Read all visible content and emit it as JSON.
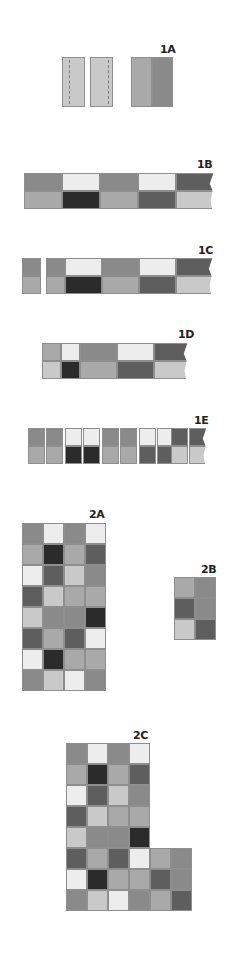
{
  "palette": {
    "W": "#ededed",
    "L": "#c9c9c9",
    "M": "#a9a9a9",
    "G": "#8a8a8a",
    "D": "#5e5e5e",
    "K": "#2b2b2b"
  },
  "labels": [
    {
      "id": "1A",
      "text": "1A",
      "x": 160,
      "y": 43
    },
    {
      "id": "1B",
      "text": "1B",
      "x": 197,
      "y": 158
    },
    {
      "id": "1C",
      "text": "1C",
      "x": 198,
      "y": 244
    },
    {
      "id": "1D",
      "text": "1D",
      "x": 178,
      "y": 328
    },
    {
      "id": "1E",
      "text": "1E",
      "x": 194,
      "y": 414
    },
    {
      "id": "2A",
      "text": "2A",
      "x": 89,
      "y": 508
    },
    {
      "id": "2B",
      "text": "2B",
      "x": 201,
      "y": 563
    },
    {
      "id": "2C",
      "text": "2C",
      "x": 133,
      "y": 729
    }
  ],
  "step_1A": {
    "strips": [
      {
        "x": 62,
        "y": 57,
        "w": 23,
        "h": 50,
        "color": "L",
        "seam_x": 6
      },
      {
        "x": 90,
        "y": 57,
        "w": 23,
        "h": 50,
        "color": "L",
        "seam_x": 17
      },
      {
        "x": 131,
        "y": 57,
        "w": 21,
        "h": 50,
        "color": "M"
      },
      {
        "x": 152,
        "y": 57,
        "w": 21,
        "h": 50,
        "color": "G"
      }
    ]
  },
  "step_1B": {
    "x": 24,
    "y": 173,
    "unit_w": 38,
    "unit_h": 18,
    "top": [
      "G",
      "W",
      "G",
      "W",
      "D"
    ],
    "bottom": [
      "M",
      "K",
      "M",
      "D",
      "L"
    ]
  },
  "step_1C": {
    "pieces": [
      {
        "x": 22,
        "y": 258,
        "w": 19,
        "top": "G",
        "bottom": "M"
      },
      {
        "x": 46,
        "y": 258,
        "w": 19,
        "top": "G",
        "bottom": "M"
      }
    ],
    "x": 65,
    "y": 258,
    "unit_w": 37,
    "unit_h": 18,
    "top": [
      "W",
      "G",
      "W",
      "D"
    ],
    "bottom": [
      "K",
      "M",
      "D",
      "L"
    ]
  },
  "step_1D": {
    "x": 42,
    "y": 343,
    "unit_h": 18,
    "cells_top": [
      {
        "w": 19,
        "color": "M"
      },
      {
        "w": 19,
        "color": "W"
      },
      {
        "w": 37,
        "color": "G"
      },
      {
        "w": 37,
        "color": "W"
      },
      {
        "w": 34,
        "color": "D"
      }
    ],
    "cells_bottom": [
      {
        "w": 19,
        "color": "L"
      },
      {
        "w": 19,
        "color": "K"
      },
      {
        "w": 37,
        "color": "M"
      },
      {
        "w": 37,
        "color": "D"
      },
      {
        "w": 34,
        "color": "L"
      }
    ]
  },
  "step_1E": {
    "y": 428,
    "unit_w": 17,
    "unit_h": 18,
    "pairs": [
      {
        "x": 28,
        "top": [
          "G",
          "G"
        ],
        "bottom": [
          "M",
          "M"
        ],
        "gap": 1
      },
      {
        "x": 65,
        "top": [
          "W",
          "W"
        ],
        "bottom": [
          "K",
          "K"
        ],
        "gap": 1
      },
      {
        "x": 102,
        "top": [
          "G",
          "G"
        ],
        "bottom": [
          "M",
          "M"
        ],
        "gap": 1
      },
      {
        "x": 139,
        "top": [
          "W",
          "W"
        ],
        "bottom": [
          "D",
          "D"
        ],
        "gap": 1
      },
      {
        "x": 171,
        "top": [
          "D",
          "D"
        ],
        "bottom": [
          "L",
          "L"
        ],
        "gap": 1
      }
    ]
  },
  "step_2A": {
    "x": 22,
    "y": 523,
    "cell": 21,
    "cols": 4,
    "rows": [
      [
        "G",
        "W",
        "G",
        "W"
      ],
      [
        "M",
        "K",
        "M",
        "D"
      ],
      [
        "W",
        "D",
        "L",
        "G"
      ],
      [
        "D",
        "L",
        "M",
        "M"
      ],
      [
        "L",
        "G",
        "G",
        "K"
      ],
      [
        "D",
        "M",
        "D",
        "W"
      ],
      [
        "W",
        "K",
        "M",
        "M"
      ],
      [
        "G",
        "L",
        "W",
        "G"
      ]
    ]
  },
  "step_2B": {
    "x": 174,
    "y": 577,
    "cell": 21,
    "cols": 2,
    "rows": [
      [
        "M",
        "G"
      ],
      [
        "D",
        "G"
      ],
      [
        "L",
        "D"
      ]
    ]
  },
  "step_2C": {
    "x": 66,
    "y": 743,
    "cell": 21,
    "rows": [
      [
        "G",
        "W",
        "G",
        "W"
      ],
      [
        "M",
        "K",
        "M",
        "D"
      ],
      [
        "W",
        "D",
        "L",
        "G"
      ],
      [
        "D",
        "L",
        "M",
        "M"
      ],
      [
        "L",
        "G",
        "G",
        "K"
      ],
      [
        "D",
        "M",
        "D",
        "W",
        "M",
        "G"
      ],
      [
        "W",
        "K",
        "M",
        "M",
        "D",
        "G"
      ],
      [
        "G",
        "L",
        "W",
        "G",
        "M",
        "D"
      ]
    ]
  }
}
